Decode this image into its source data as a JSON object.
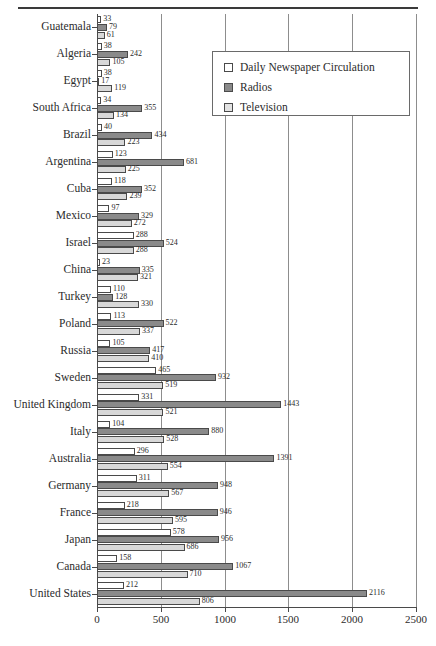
{
  "chart_data": {
    "type": "bar",
    "orientation": "horizontal",
    "title": "",
    "xlabel": "",
    "ylabel": "",
    "xlim": [
      0,
      2500
    ],
    "xticks": [
      0,
      500,
      1000,
      1500,
      2000,
      2500
    ],
    "grid": true,
    "legend_position": "top-right",
    "legend": [
      "Daily Newspaper Circulation",
      "Radios",
      "Television"
    ],
    "colors": {
      "Daily Newspaper Circulation": "#ffffff",
      "Radios": "#8a8a8a",
      "Television": "#d8d8d8",
      "outline": "#4a4a4a",
      "gridline": "#8d8d8d"
    },
    "categories": [
      "Guatemala",
      "Algeria",
      "Egypt",
      "South Africa",
      "Brazil",
      "Argentina",
      "Cuba",
      "Mexico",
      "Israel",
      "China",
      "Turkey",
      "Poland",
      "Russia",
      "Sweden",
      "United Kingdom",
      "Italy",
      "Australia",
      "Germany",
      "France",
      "Japan",
      "Canada",
      "United States"
    ],
    "series": [
      {
        "name": "Daily Newspaper Circulation",
        "values": [
          33,
          38,
          38,
          34,
          40,
          123,
          118,
          97,
          288,
          23,
          110,
          113,
          105,
          465,
          331,
          104,
          296,
          311,
          218,
          578,
          158,
          212
        ]
      },
      {
        "name": "Radios",
        "values": [
          79,
          242,
          17,
          355,
          434,
          681,
          352,
          329,
          524,
          335,
          128,
          522,
          417,
          932,
          1443,
          880,
          1391,
          948,
          946,
          956,
          1067,
          2116
        ]
      },
      {
        "name": "Television",
        "values": [
          61,
          105,
          119,
          134,
          223,
          225,
          239,
          272,
          288,
          321,
          330,
          337,
          410,
          519,
          521,
          528,
          554,
          567,
          595,
          686,
          710,
          806
        ]
      }
    ]
  }
}
